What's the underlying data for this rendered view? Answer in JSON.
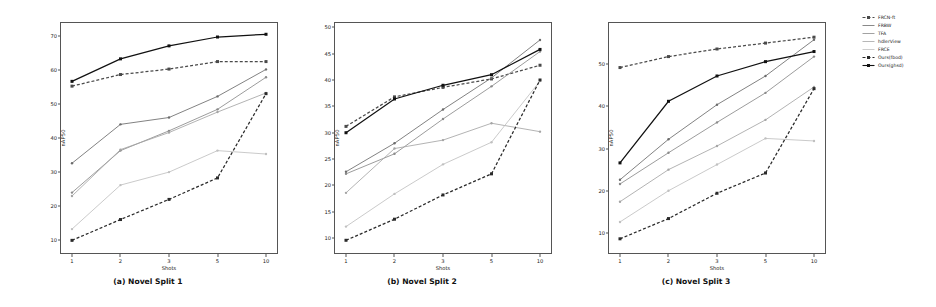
{
  "figure": {
    "panels": [
      {
        "id": "a",
        "caption": "(a) Novel Split 1",
        "xlabel": "Shots",
        "ylabel": "nAP50"
      },
      {
        "id": "b",
        "caption": "(b) Novel Split 2",
        "xlabel": "Shots",
        "ylabel": "nAP50"
      },
      {
        "id": "c",
        "caption": "(c) Novel Split 3",
        "xlabel": "Shots",
        "ylabel": "nAP50"
      }
    ]
  },
  "legend": {
    "position": "right",
    "items": [
      {
        "label": "FRCN-ft",
        "color": "#4a4a4a",
        "dash": "3,2",
        "marker": "square"
      },
      {
        "label": "FRBW",
        "color": "#6b6b6b",
        "dash": "none",
        "marker": "dot"
      },
      {
        "label": "TFA",
        "color": "#8a8a8a",
        "dash": "none",
        "marker": "dot"
      },
      {
        "label": "hdlerView",
        "color": "#a5a5a5",
        "dash": "none",
        "marker": "dot"
      },
      {
        "label": "FRCE",
        "color": "#c0c0c0",
        "dash": "none",
        "marker": "dot"
      },
      {
        "label": "Ours(fbod)",
        "color": "#2a2a2a",
        "dash": "3,2",
        "marker": "square"
      },
      {
        "label": "Ours(ghsd)",
        "color": "#111111",
        "dash": "none",
        "marker": "square"
      }
    ]
  },
  "chart_data": [
    {
      "type": "line",
      "title": "(a) Novel Split 1",
      "xlabel": "Shots",
      "ylabel": "nAP50",
      "x": [
        1,
        2,
        3,
        5,
        10
      ],
      "xticklabels": [
        "1",
        "2",
        "3",
        "5",
        "10"
      ],
      "yticks": [
        10,
        20,
        30,
        40,
        50,
        60,
        70
      ],
      "ylim": [
        6,
        74
      ],
      "grid": false,
      "series": [
        {
          "name": "FRCN-ft",
          "values": [
            55.2,
            58.6,
            60.2,
            62.4,
            62.4
          ]
        },
        {
          "name": "FRBW",
          "values": [
            32.6,
            44.0,
            46.0,
            52.2,
            60.1
          ]
        },
        {
          "name": "TFA",
          "values": [
            24.0,
            36.3,
            42.1,
            48.4,
            57.8
          ]
        },
        {
          "name": "hdlerView",
          "values": [
            23.0,
            36.6,
            41.6,
            47.6,
            53.2
          ]
        },
        {
          "name": "FRCE",
          "values": [
            13.3,
            26.2,
            30.0,
            36.3,
            35.3
          ]
        },
        {
          "name": "Ours(fbod)",
          "values": [
            10.0,
            16.1,
            22.0,
            28.3,
            53.0
          ]
        },
        {
          "name": "Ours(ghsd)",
          "values": [
            56.6,
            63.2,
            67.0,
            69.6,
            70.4
          ]
        }
      ]
    },
    {
      "type": "line",
      "title": "(b) Novel Split 2",
      "xlabel": "Shots",
      "ylabel": "nAP50",
      "x": [
        1,
        2,
        3,
        5,
        10
      ],
      "xticklabels": [
        "1",
        "2",
        "3",
        "5",
        "10"
      ],
      "yticks": [
        10,
        15,
        20,
        25,
        30,
        35,
        40,
        45,
        50
      ],
      "ylim": [
        7,
        51
      ],
      "grid": false,
      "series": [
        {
          "name": "FRCN-ft",
          "values": [
            31.2,
            36.8,
            38.6,
            40.2,
            42.8
          ]
        },
        {
          "name": "FRBW",
          "values": [
            22.6,
            28.0,
            34.4,
            40.4,
            47.6
          ]
        },
        {
          "name": "TFA",
          "values": [
            22.2,
            26.0,
            32.6,
            38.8,
            45.4
          ]
        },
        {
          "name": "hdlerView",
          "values": [
            18.6,
            27.0,
            28.6,
            31.8,
            30.2
          ]
        },
        {
          "name": "FRCE",
          "values": [
            12.2,
            18.4,
            24.0,
            28.2,
            39.8
          ]
        },
        {
          "name": "Ours(fbod)",
          "values": [
            9.6,
            13.6,
            18.2,
            22.2,
            40.0
          ]
        },
        {
          "name": "Ours(ghsd)",
          "values": [
            30.0,
            36.4,
            39.0,
            41.0,
            45.8
          ]
        }
      ]
    },
    {
      "type": "line",
      "title": "(c) Novel Split 3",
      "xlabel": "Shots",
      "ylabel": "nAP50",
      "x": [
        1,
        2,
        3,
        5,
        10
      ],
      "xticklabels": [
        "1",
        "2",
        "3",
        "5",
        "10"
      ],
      "yticks": [
        10,
        20,
        30,
        40,
        50
      ],
      "ylim": [
        5,
        60
      ],
      "grid": false,
      "series": [
        {
          "name": "FRCN-ft",
          "values": [
            49.2,
            51.8,
            53.6,
            55.0,
            56.4
          ]
        },
        {
          "name": "FRBW",
          "values": [
            22.6,
            32.2,
            40.4,
            47.2,
            55.8
          ]
        },
        {
          "name": "TFA",
          "values": [
            21.6,
            29.0,
            36.2,
            43.2,
            51.8
          ]
        },
        {
          "name": "hdlerView",
          "values": [
            17.4,
            25.0,
            30.6,
            36.8,
            44.6
          ]
        },
        {
          "name": "FRCE",
          "values": [
            12.6,
            20.0,
            26.2,
            32.4,
            31.8
          ]
        },
        {
          "name": "Ours(fbod)",
          "values": [
            8.6,
            13.4,
            19.4,
            24.2,
            44.2
          ]
        },
        {
          "name": "Ours(ghsd)",
          "values": [
            26.6,
            41.2,
            47.2,
            50.6,
            53.0
          ]
        }
      ]
    }
  ]
}
